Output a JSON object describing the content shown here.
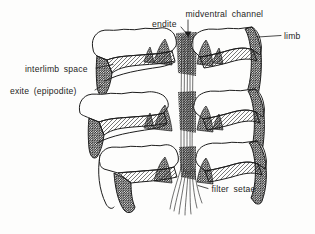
{
  "figure": {
    "labels": {
      "midventral_channel": "midventral channel",
      "endite": "endite",
      "limb": "limb",
      "interlimb_space": "interlimb space",
      "exite_epipodite": "exite (epipodite)",
      "filter_setae": "filter setae"
    },
    "colors": {
      "background": "#fdfdfc",
      "ink": "#1d1d1d",
      "hatch_light": "#4a4a4a",
      "hatch_dark": "#161616"
    }
  }
}
